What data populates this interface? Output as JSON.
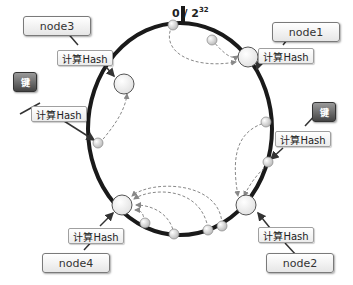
{
  "origin_label": {
    "base": "0 / 2",
    "exp": "32"
  },
  "nodes": [
    {
      "name": "node3",
      "hash_label": "计算Hash"
    },
    {
      "name": "node1",
      "hash_label": "计算Hash"
    },
    {
      "name": "node4",
      "hash_label": "计算Hash"
    },
    {
      "name": "node2",
      "hash_label": "计算Hash"
    }
  ],
  "keys": [
    {
      "label": "键",
      "hash_label": "计算Hash"
    },
    {
      "label": "键",
      "hash_label": "计算Hash"
    }
  ],
  "colors": {
    "ring": "#1a1a1a",
    "node_fill": "#f4f4f4",
    "key_fill": "#555555",
    "dashed_arrow": "#888888"
  }
}
